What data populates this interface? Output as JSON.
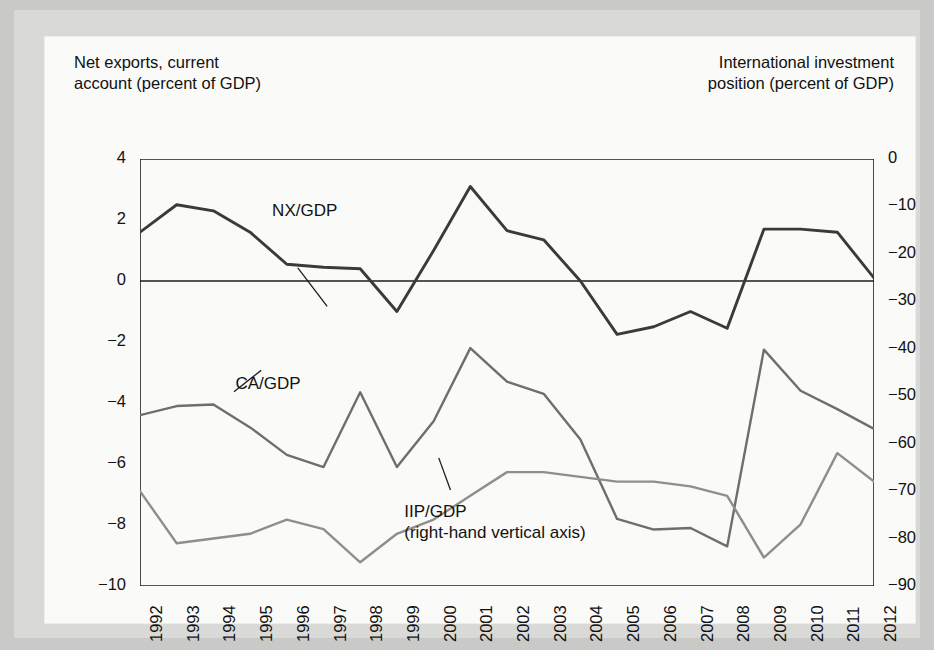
{
  "figure": {
    "left_axis_title": "Net exports, current\naccount (percent of GDP)",
    "right_axis_title": "International investment\nposition (percent of GDP)"
  },
  "chart_data": {
    "type": "line",
    "title": "",
    "xlabel": "",
    "ylabel": "Net exports, current account (percent of GDP)",
    "y2label": "International investment position (percent of GDP)",
    "ylim": [
      -10,
      4
    ],
    "y2lim": [
      -90,
      0
    ],
    "yticks": [
      "4",
      "2",
      "0",
      "−2",
      "−4",
      "−6",
      "−8",
      "−10"
    ],
    "ytick_values": [
      4,
      2,
      0,
      -2,
      -4,
      -6,
      -8,
      -10
    ],
    "y2ticks": [
      "0",
      "−10",
      "−20",
      "−30",
      "−40",
      "−50",
      "−60",
      "−70",
      "−80",
      "−90"
    ],
    "y2tick_values": [
      0,
      -10,
      -20,
      -30,
      -40,
      -50,
      -60,
      -70,
      -80,
      -90
    ],
    "grid": false,
    "legend_position": "inline-annotations",
    "zero_line": true,
    "categories": [
      "1992",
      "1993",
      "1994",
      "1995",
      "1996",
      "1997",
      "1998",
      "1999",
      "2000",
      "2001",
      "2002",
      "2003",
      "2004",
      "2005",
      "2006",
      "2007",
      "2008",
      "2009",
      "2010",
      "2011",
      "2012"
    ],
    "series": [
      {
        "name": "NX/GDP",
        "axis": "left",
        "color": "#3a3a3a",
        "values": [
          1.6,
          2.5,
          2.3,
          1.6,
          0.55,
          0.45,
          0.4,
          -1.0,
          1.0,
          3.1,
          1.65,
          1.35,
          0.0,
          -1.75,
          -1.5,
          -1.0,
          -1.55,
          1.7,
          1.7,
          1.6,
          0.1
        ]
      },
      {
        "name": "CA/GDP",
        "axis": "left",
        "color": "#6e6e6e",
        "values": [
          -4.4,
          -4.1,
          -4.05,
          -4.8,
          -5.7,
          -6.1,
          -3.65,
          -6.1,
          -4.6,
          -2.2,
          -3.3,
          -3.7,
          -5.2,
          -7.8,
          -8.15,
          -8.1,
          -8.7,
          -2.25,
          -3.6,
          -4.2,
          -4.85
        ]
      },
      {
        "name": "IIP/GDP",
        "axis": "right",
        "color": "#8e8e8e",
        "values": [
          -70,
          -81,
          -80,
          -79,
          -76,
          -78,
          -85,
          -79,
          -76,
          -71,
          -66,
          -66,
          -67,
          -68,
          -68,
          -69,
          -71,
          -84,
          -77,
          -62,
          -68
        ]
      }
    ],
    "annotations": [
      {
        "id": "nx-label",
        "text": "NX/GDP",
        "x_frac": 0.18,
        "y_frac": 0.095
      },
      {
        "id": "ca-label",
        "text": "CA/GDP",
        "x_frac": 0.13,
        "y_frac": 0.5
      },
      {
        "id": "iip-label",
        "text": "IIP/GDP\n(right-hand vertical axis)",
        "x_frac": 0.36,
        "y_frac": 0.8
      }
    ]
  }
}
